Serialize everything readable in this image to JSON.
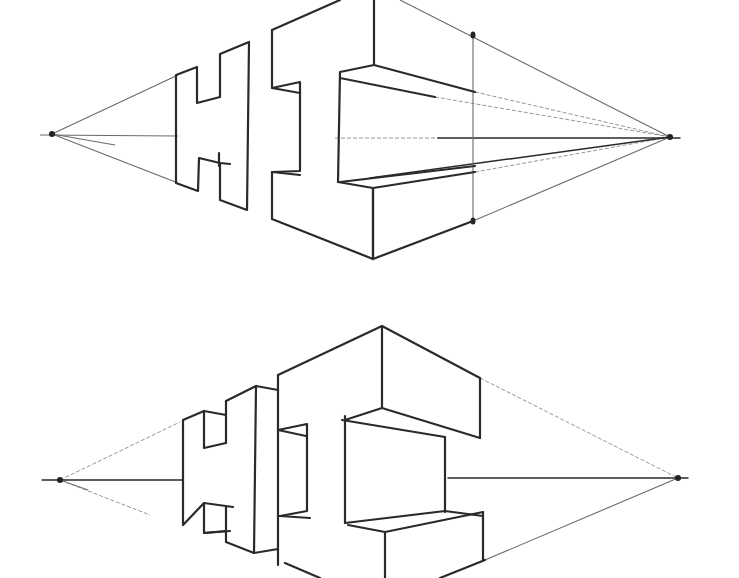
{
  "figure": {
    "word": "HI",
    "colors": {
      "paper": "#ffffff",
      "ink": "#2a2a2a",
      "guide": "#8a8a8a"
    },
    "top_drawing": {
      "horizon_y": 137,
      "vanishing_points": [
        {
          "x": 52,
          "y": 134
        },
        {
          "x": 670,
          "y": 137
        }
      ],
      "marker_dots": [
        {
          "x": 473,
          "y": 35
        },
        {
          "x": 473,
          "y": 221
        }
      ]
    },
    "bottom_drawing": {
      "horizon_y": 480,
      "vanishing_points": [
        {
          "x": 60,
          "y": 480
        },
        {
          "x": 678,
          "y": 478
        }
      ]
    }
  }
}
